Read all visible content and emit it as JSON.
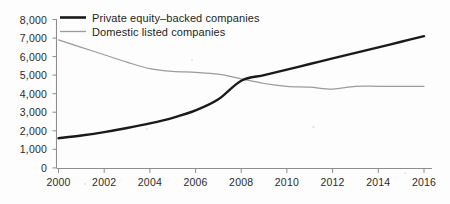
{
  "chart_data": {
    "type": "line",
    "title": "",
    "subtitle": "",
    "xlabel": "",
    "ylabel": "",
    "xlim": [
      2000,
      2016
    ],
    "ylim": [
      0,
      8000
    ],
    "grid": false,
    "legend_position": "top-left",
    "x": [
      2000,
      2001,
      2002,
      2003,
      2004,
      2005,
      2006,
      2007,
      2008,
      2009,
      2010,
      2011,
      2012,
      2013,
      2014,
      2015,
      2016
    ],
    "series": [
      {
        "name": "Private equity–backed companies",
        "color": "#1a1a1a",
        "values": [
          1600,
          1750,
          1930,
          2150,
          2400,
          2700,
          3100,
          3700,
          4700,
          5000,
          5300,
          5600,
          5900,
          6200,
          6500,
          6800,
          7100
        ]
      },
      {
        "name": "Domestic listed companies",
        "color": "#9b9b9b",
        "values": [
          6900,
          6500,
          6100,
          5700,
          5350,
          5200,
          5150,
          5050,
          4800,
          4550,
          4400,
          4350,
          4250,
          4400,
          4400,
          4400,
          4400
        ]
      }
    ],
    "y_ticks": [
      0,
      1000,
      2000,
      3000,
      4000,
      5000,
      6000,
      7000,
      8000
    ],
    "y_tick_labels": [
      "0",
      "1,000",
      "2,000",
      "3,000",
      "4,000",
      "5,000",
      "6,000",
      "7,000",
      "8,000"
    ],
    "x_ticks": [
      2000,
      2002,
      2004,
      2006,
      2008,
      2010,
      2012,
      2014,
      2016
    ],
    "x_tick_labels": [
      "2000",
      "2002",
      "2004",
      "2006",
      "2008",
      "2010",
      "2012",
      "2014",
      "2016"
    ],
    "legend": [
      {
        "label": "Private equity–backed companies",
        "marker": "thick-black-line"
      },
      {
        "label": "Domestic listed companies",
        "marker": "thin-gray-line"
      }
    ],
    "annotations": []
  }
}
